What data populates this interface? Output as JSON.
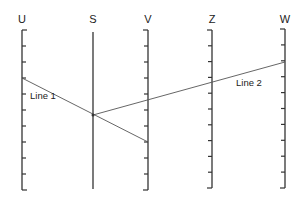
{
  "diagram": {
    "type": "nomogram",
    "stroke_color": "#333333",
    "connector_color": "#555555",
    "axes": [
      {
        "id": "U",
        "label": "U",
        "x": 22,
        "top": 30,
        "bottom": 190,
        "tick_side": "right",
        "ticks": 11,
        "label_y": 14
      },
      {
        "id": "S",
        "label": "S",
        "x": 93,
        "top": 32,
        "bottom": 189,
        "tick_side": "none",
        "ticks": 0,
        "label_y": 14
      },
      {
        "id": "V",
        "label": "V",
        "x": 148,
        "top": 30,
        "bottom": 190,
        "tick_side": "left",
        "ticks": 11,
        "label_y": 14
      },
      {
        "id": "Z",
        "label": "Z",
        "x": 212,
        "top": 30,
        "bottom": 188,
        "tick_side": "left",
        "ticks": 11,
        "label_y": 14
      },
      {
        "id": "W",
        "label": "W",
        "x": 285,
        "top": 29,
        "bottom": 188,
        "tick_side": "left",
        "ticks": 11,
        "label_y": 14
      }
    ],
    "lines": [
      {
        "id": "line1",
        "label": "Line 1",
        "from": [
          22,
          78
        ],
        "to": [
          148,
          142
        ],
        "label_x": 30,
        "label_y": 91
      },
      {
        "id": "line2",
        "label": "Line 2",
        "from": [
          93,
          115
        ],
        "to": [
          285,
          62
        ],
        "label_x": 236,
        "label_y": 78
      }
    ],
    "pivot_point": {
      "x": 93,
      "y": 115
    }
  }
}
